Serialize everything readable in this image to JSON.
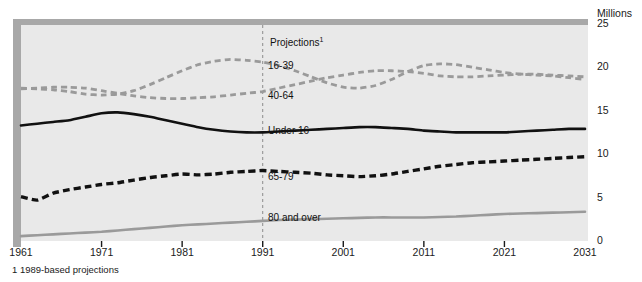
{
  "chart_data": {
    "type": "line",
    "title": "",
    "subtitle": "",
    "xlabel": "",
    "ylabel": "Millions",
    "y_unit_label": "Millions",
    "xlim": [
      1961,
      2031
    ],
    "ylim": [
      0,
      25
    ],
    "yticks": [
      0,
      5,
      10,
      15,
      20,
      25
    ],
    "ytick_labels": [
      "0",
      "5",
      "10",
      "15",
      "20",
      "25"
    ],
    "xticks": [
      1961,
      1971,
      1981,
      1991,
      2001,
      2011,
      2021,
      2031
    ],
    "xtick_labels": [
      "1961",
      "1971",
      "1981",
      "1991",
      "2001",
      "2011",
      "2021",
      "2031"
    ],
    "grid": false,
    "legend_position": "inline-annotations",
    "projection_start": 1991,
    "projection_marker_label": "Projections",
    "projection_marker_footnote_ref": "1",
    "footnote": "1 1989-based projections",
    "colors": {
      "plot_background": "#e9e9e9",
      "frame_shadow": "#a8a8a8",
      "grey_series": "#9a9a9a",
      "black_series": "#111111",
      "projection_line": "#8c8c8c",
      "text": "#1a1a1a"
    },
    "series": [
      {
        "name": "16-39",
        "label": "16-39",
        "style": "dashed",
        "color": "#9a9a9a",
        "x": [
          1961,
          1963,
          1965,
          1967,
          1969,
          1971,
          1973,
          1975,
          1977,
          1979,
          1981,
          1983,
          1985,
          1987,
          1989,
          1991,
          1993,
          1995,
          1997,
          1999,
          2001,
          2003,
          2005,
          2007,
          2009,
          2011,
          2013,
          2015,
          2017,
          2019,
          2021,
          2023,
          2025,
          2027,
          2029,
          2031
        ],
        "values": [
          17.5,
          17.4,
          17.3,
          17.1,
          16.8,
          16.7,
          16.8,
          17.2,
          17.9,
          18.7,
          19.5,
          20.2,
          20.6,
          20.8,
          20.7,
          20.5,
          20.1,
          19.5,
          18.8,
          18.1,
          17.6,
          17.5,
          17.8,
          18.5,
          19.4,
          20.1,
          20.3,
          20.2,
          19.9,
          19.6,
          19.3,
          19.1,
          19.0,
          18.9,
          18.7,
          18.5
        ]
      },
      {
        "name": "40-64",
        "label": "40-64",
        "style": "dashed",
        "color": "#9a9a9a",
        "x": [
          1961,
          1963,
          1965,
          1967,
          1969,
          1971,
          1973,
          1975,
          1977,
          1979,
          1981,
          1983,
          1985,
          1987,
          1989,
          1991,
          1993,
          1995,
          1997,
          1999,
          2001,
          2003,
          2005,
          2007,
          2009,
          2011,
          2013,
          2015,
          2017,
          2019,
          2021,
          2023,
          2025,
          2027,
          2029,
          2031
        ],
        "values": [
          17.4,
          17.5,
          17.6,
          17.6,
          17.5,
          17.2,
          16.9,
          16.6,
          16.4,
          16.3,
          16.3,
          16.4,
          16.5,
          16.7,
          16.9,
          17.1,
          17.5,
          17.9,
          18.3,
          18.7,
          19.0,
          19.3,
          19.5,
          19.5,
          19.4,
          19.2,
          18.9,
          18.8,
          18.8,
          18.9,
          19.0,
          19.1,
          19.1,
          19.0,
          18.9,
          18.8
        ]
      },
      {
        "name": "Under 16",
        "label": "Under 16",
        "style": "solid",
        "color": "#111111",
        "x": [
          1961,
          1963,
          1965,
          1967,
          1969,
          1971,
          1973,
          1975,
          1977,
          1979,
          1981,
          1983,
          1985,
          1987,
          1989,
          1991,
          1993,
          1995,
          1997,
          1999,
          2001,
          2003,
          2005,
          2007,
          2009,
          2011,
          2013,
          2015,
          2017,
          2019,
          2021,
          2023,
          2025,
          2027,
          2029,
          2031
        ],
        "values": [
          13.2,
          13.4,
          13.6,
          13.8,
          14.2,
          14.6,
          14.7,
          14.5,
          14.2,
          13.8,
          13.4,
          13.0,
          12.7,
          12.5,
          12.4,
          12.4,
          12.5,
          12.6,
          12.7,
          12.8,
          12.9,
          13.0,
          13.0,
          12.9,
          12.8,
          12.6,
          12.5,
          12.4,
          12.4,
          12.4,
          12.4,
          12.5,
          12.6,
          12.7,
          12.8,
          12.8
        ]
      },
      {
        "name": "65-79",
        "label": "65-79",
        "style": "dashed-heavy",
        "color": "#111111",
        "x": [
          1961,
          1963,
          1965,
          1967,
          1969,
          1971,
          1973,
          1975,
          1977,
          1979,
          1981,
          1983,
          1985,
          1987,
          1989,
          1991,
          1993,
          1995,
          1997,
          1999,
          2001,
          2003,
          2005,
          2007,
          2009,
          2011,
          2013,
          2015,
          2017,
          2019,
          2021,
          2023,
          2025,
          2027,
          2029,
          2031
        ],
        "values": [
          5.0,
          4.6,
          5.4,
          5.8,
          6.1,
          6.4,
          6.6,
          6.9,
          7.2,
          7.4,
          7.6,
          7.5,
          7.6,
          7.8,
          7.9,
          8.0,
          7.9,
          7.8,
          7.7,
          7.5,
          7.4,
          7.3,
          7.4,
          7.6,
          7.9,
          8.2,
          8.5,
          8.7,
          8.9,
          9.0,
          9.1,
          9.2,
          9.3,
          9.4,
          9.5,
          9.6
        ]
      },
      {
        "name": "80 and over",
        "label": "80 and over",
        "style": "solid",
        "color": "#9a9a9a",
        "x": [
          1961,
          1963,
          1965,
          1967,
          1969,
          1971,
          1973,
          1975,
          1977,
          1979,
          1981,
          1983,
          1985,
          1987,
          1989,
          1991,
          1993,
          1995,
          1997,
          1999,
          2001,
          2003,
          2005,
          2007,
          2009,
          2011,
          2013,
          2015,
          2017,
          2019,
          2021,
          2023,
          2025,
          2027,
          2029,
          2031
        ],
        "values": [
          0.45,
          0.55,
          0.65,
          0.75,
          0.85,
          0.95,
          1.1,
          1.25,
          1.4,
          1.55,
          1.7,
          1.8,
          1.9,
          2.0,
          2.1,
          2.2,
          2.3,
          2.35,
          2.4,
          2.45,
          2.5,
          2.55,
          2.6,
          2.6,
          2.6,
          2.6,
          2.65,
          2.7,
          2.8,
          2.9,
          3.0,
          3.05,
          3.1,
          3.15,
          3.2,
          3.25
        ]
      }
    ],
    "annotations": [
      {
        "text": "Projections",
        "superscript": "1",
        "x_px": 270,
        "y_px": 38
      },
      {
        "text": "16-39",
        "superscript": "",
        "x_px": 268,
        "y_px": 61
      },
      {
        "text": "40-64",
        "superscript": "",
        "x_px": 268,
        "y_px": 91
      },
      {
        "text": "Under 16",
        "superscript": "",
        "x_px": 268,
        "y_px": 126
      },
      {
        "text": "65-79",
        "superscript": "",
        "x_px": 268,
        "y_px": 172
      },
      {
        "text": "80 and over",
        "superscript": "",
        "x_px": 268,
        "y_px": 213
      }
    ]
  }
}
